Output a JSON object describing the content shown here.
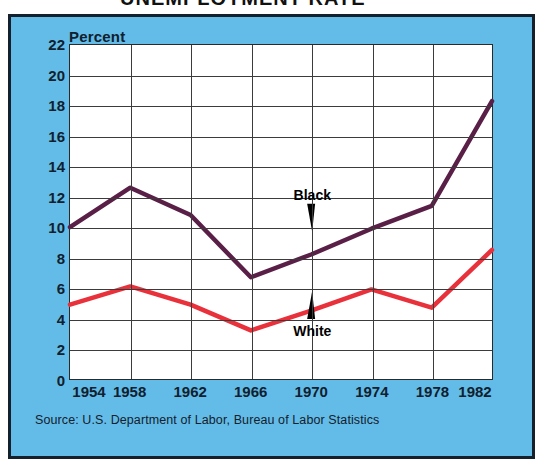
{
  "title_partial": "UNEMPLOYMENT RATE",
  "panel": {
    "background_color": "#63bce8",
    "border_color": "#14202c"
  },
  "axis_label": "Percent",
  "source": "Source: U.S. Department of Labor, Bureau of Labor Statistics",
  "annotations": [
    {
      "name": "black-series-label",
      "text": "Black",
      "x_year": 1970,
      "y_value": 12.2
    },
    {
      "name": "white-series-label",
      "text": "White",
      "x_year": 1970,
      "y_value": 3.3
    }
  ],
  "chart_data": {
    "type": "line",
    "title": "UNEMPLOYMENT RATE",
    "xlabel": "",
    "ylabel": "Percent",
    "categories": [
      1954,
      1958,
      1962,
      1966,
      1970,
      1974,
      1978,
      1982
    ],
    "xtick_labels": [
      "1954",
      "1958",
      "1962",
      "1966",
      "1970",
      "1974",
      "1978",
      "1982"
    ],
    "ytick_labels": [
      "0",
      "2",
      "4",
      "6",
      "8",
      "10",
      "12",
      "14",
      "16",
      "18",
      "20",
      "22"
    ],
    "ylim": [
      0,
      22
    ],
    "ytick_step": 2,
    "grid": true,
    "legend": "inline-annotations",
    "series": [
      {
        "name": "Black",
        "color": "#5a1f47",
        "values": [
          10.0,
          12.6,
          10.8,
          6.7,
          8.2,
          9.9,
          11.4,
          18.3
        ]
      },
      {
        "name": "White",
        "color": "#e8313a",
        "values": [
          4.9,
          6.1,
          4.9,
          3.2,
          4.5,
          5.9,
          4.7,
          8.5
        ]
      }
    ]
  }
}
